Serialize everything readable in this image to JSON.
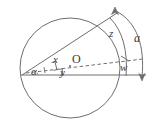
{
  "figure": {
    "kind": "geometry-diagram",
    "stroke_color": "#6e6e6e",
    "text_color": "#3a3a3a",
    "background": "#ffffff",
    "labels": {
      "arc_total": "a",
      "arc_upper": "z",
      "arc_lower": "w",
      "segment_upper": "x",
      "segment_lower": "y",
      "center": "O",
      "angle": "α"
    },
    "geometry": {
      "circle": {
        "cx": 70,
        "cy": 68,
        "r": 50
      },
      "vertex": {
        "x": 22,
        "y": 75
      },
      "baseline": {
        "x1": 21,
        "y1": 75,
        "x2": 145,
        "y2": 75
      },
      "chord_end": {
        "x": 117,
        "y": 13
      },
      "dashed_end": {
        "x": 143,
        "y": 59
      },
      "arc_outer": {
        "x1": 116,
        "y1": 10,
        "x2": 142,
        "y2": 77
      },
      "arrow_top": {
        "x": 115,
        "y": 8,
        "direction": "up"
      },
      "arrow_bottom": {
        "x": 142,
        "y": 79,
        "direction": "down"
      }
    }
  }
}
